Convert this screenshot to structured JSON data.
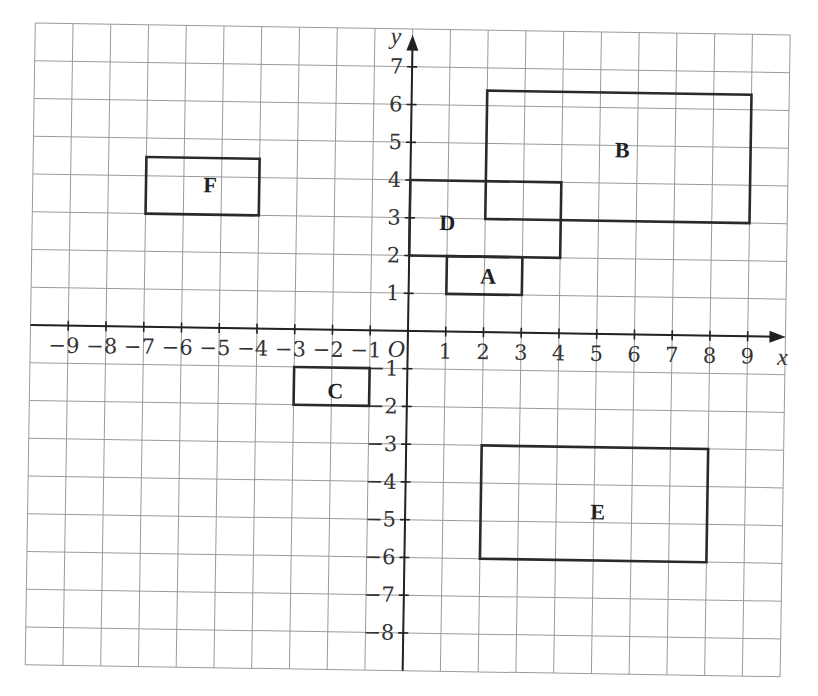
{
  "diagram": {
    "type": "coordinate-grid",
    "axes": {
      "x_label": "x",
      "y_label": "y",
      "origin_label": "O",
      "x_ticks": [
        "−9",
        "−8",
        "−7",
        "−6",
        "−5",
        "−4",
        "−3",
        "−2",
        "−1",
        "1",
        "2",
        "3",
        "4",
        "5",
        "6",
        "7",
        "8",
        "9"
      ],
      "x_tick_values": [
        -9,
        -8,
        -7,
        -6,
        -5,
        -4,
        -3,
        -2,
        -1,
        1,
        2,
        3,
        4,
        5,
        6,
        7,
        8,
        9
      ],
      "y_ticks": [
        "7",
        "6",
        "5",
        "4",
        "3",
        "2",
        "1",
        "−1",
        "−2",
        "−3",
        "−4",
        "−5",
        "−6",
        "−7",
        "−8"
      ],
      "y_tick_values": [
        7,
        6,
        5,
        4,
        3,
        2,
        1,
        -1,
        -2,
        -3,
        -4,
        -5,
        -6,
        -7,
        -8
      ],
      "grid_x_range": [
        -10,
        10
      ],
      "grid_y_range": [
        -9,
        8
      ]
    },
    "shapes": [
      {
        "label": "A",
        "x1": 1,
        "y1": 1,
        "x2": 3,
        "y2": 2
      },
      {
        "label": "B",
        "x1": 2,
        "y1": 3,
        "x2": 9,
        "y2": 6.4
      },
      {
        "label": "C",
        "x1": -3,
        "y1": -2,
        "x2": -1,
        "y2": -1
      },
      {
        "label": "D",
        "x1": 0,
        "y1": 2,
        "x2": 4,
        "y2": 4
      },
      {
        "label": "E",
        "x1": 2,
        "y1": -6,
        "x2": 8,
        "y2": -3
      },
      {
        "label": "F",
        "x1": -7,
        "y1": 3,
        "x2": -4,
        "y2": 4.5
      }
    ],
    "label_positions": {
      "A": [
        2.1,
        1.5
      ],
      "B": [
        5.6,
        4.9
      ],
      "C": [
        -1.9,
        -1.6
      ],
      "D": [
        1.0,
        2.9
      ],
      "E": [
        5.1,
        -4.7
      ],
      "F": [
        -5.3,
        3.8
      ]
    },
    "colors": {
      "grid": "#9a9a9a",
      "axis": "#222222",
      "shape": "#2a2a2a",
      "text": "#333333"
    }
  }
}
